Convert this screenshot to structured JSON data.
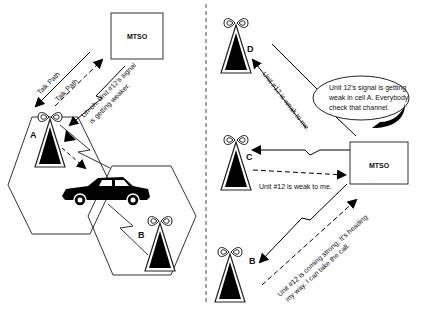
{
  "left_panel": {
    "mtso_label": "MTSO",
    "talk_path_1": "Talk Path",
    "talk_path_2": "Talk Path",
    "signal_note_line1": "Uh-oh, Unit #12's signal",
    "signal_note_line2": "is getting weaker.",
    "cell_a_label": "A",
    "cell_b_label": "B"
  },
  "right_panel": {
    "mtso_label": "MTSO",
    "cell_d_label": "D",
    "cell_c_label": "C",
    "cell_b_label": "B",
    "bubble_line1": "Unit 12's signal is getting",
    "bubble_line2": "weak in cell A. Everybody",
    "bubble_line3": "check that channel.",
    "d_reply": "Unit #12 is weak to me.",
    "c_reply": "Unit #12 is weak to me.",
    "b_reply_line1": "Unit #12 is coming strong; It's heading",
    "b_reply_line2": "my way. I can take the call."
  }
}
